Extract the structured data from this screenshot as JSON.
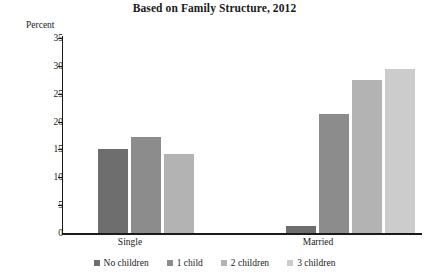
{
  "chart_data": {
    "type": "bar",
    "title": "Based on Family Structure, 2012",
    "ylabel": "Percent",
    "xlabel": "",
    "categories": [
      "Single",
      "Married"
    ],
    "ylim": [
      0,
      35
    ],
    "yticks": [
      0,
      5,
      10,
      15,
      20,
      25,
      30,
      35
    ],
    "grid": false,
    "legend_position": "bottom",
    "series": [
      {
        "name": "No children",
        "color": "#6e6e6e",
        "values": [
          15.1,
          1.3
        ]
      },
      {
        "name": "1 child",
        "color": "#8c8c8c",
        "values": [
          17.2,
          21.3
        ]
      },
      {
        "name": "2 children",
        "color": "#b3b3b3",
        "values": [
          14.2,
          27.4
        ]
      },
      {
        "name": "3 children",
        "color": "#cccccc",
        "values": [
          null,
          29.4
        ]
      }
    ]
  },
  "axis": {
    "tick_labels": [
      "35",
      "30",
      "25",
      "20",
      "15",
      "10",
      "5",
      "0"
    ]
  },
  "legend": {
    "items": [
      {
        "label": "No children"
      },
      {
        "label": "1 child"
      },
      {
        "label": "2 children"
      },
      {
        "label": "3 children"
      }
    ]
  }
}
